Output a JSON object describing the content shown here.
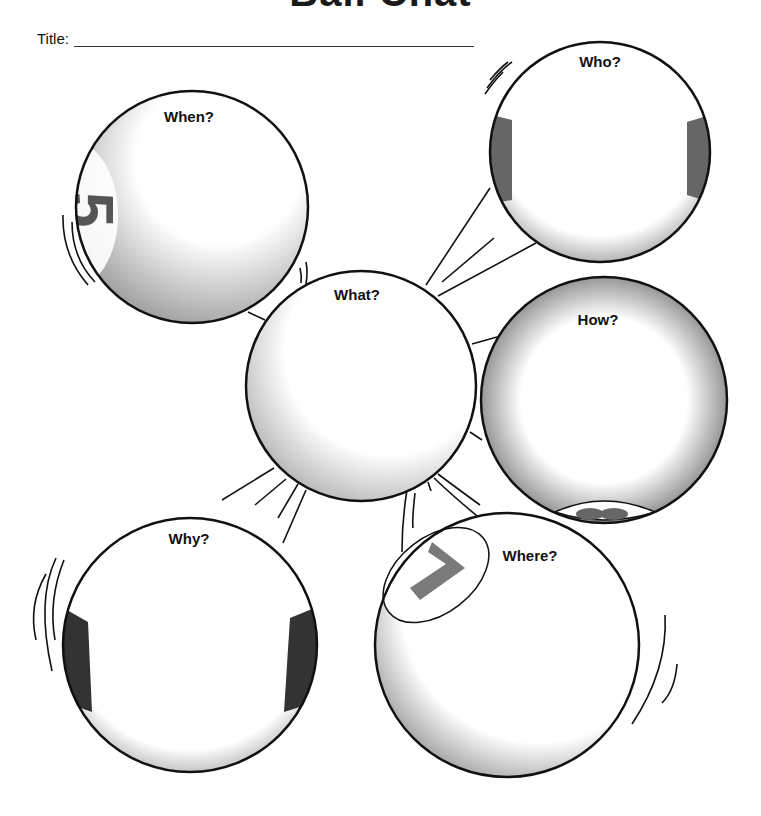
{
  "header": {
    "text": "Ball Chat"
  },
  "title_field": {
    "label": "Title:",
    "value": ""
  },
  "bubbles": [
    {
      "id": "when",
      "label": "When?",
      "ball_number": "5"
    },
    {
      "id": "who",
      "label": "Who?"
    },
    {
      "id": "what",
      "label": "What?"
    },
    {
      "id": "how",
      "label": "How?",
      "ball_number": "8"
    },
    {
      "id": "why",
      "label": "Why?"
    },
    {
      "id": "where",
      "label": "Where?",
      "ball_number": "7"
    }
  ],
  "colors": {
    "stroke": "#111111",
    "shade": "#8a8a8a",
    "stripe": "#444444",
    "number": "#7a7a7a"
  }
}
